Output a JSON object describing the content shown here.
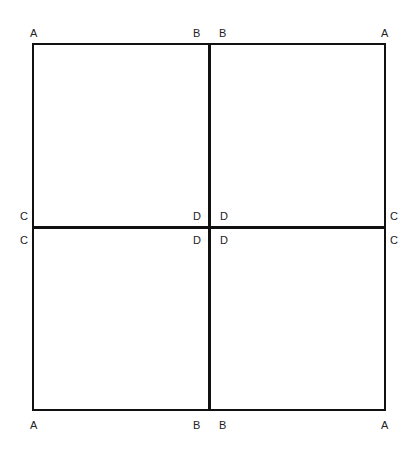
{
  "diagram": {
    "outer": {
      "left": 33,
      "top": 44,
      "right": 385,
      "bottom": 410,
      "stroke": 2
    },
    "dividers": {
      "vertical_x": 209,
      "horizontal_y": 228,
      "stroke": 3
    },
    "color": "#111111",
    "labels": {
      "top_left": "A",
      "top_mid_left": "B",
      "top_mid_right": "B",
      "top_right": "A",
      "mid_left_upper": "C",
      "mid_left_lower": "C",
      "center_ul": "D",
      "center_ur": "D",
      "center_ll": "D",
      "center_lr": "D",
      "mid_right_upper": "C",
      "mid_right_lower": "C",
      "bottom_left": "A",
      "bottom_mid_left": "B",
      "bottom_mid_right": "B",
      "bottom_right": "A"
    }
  }
}
